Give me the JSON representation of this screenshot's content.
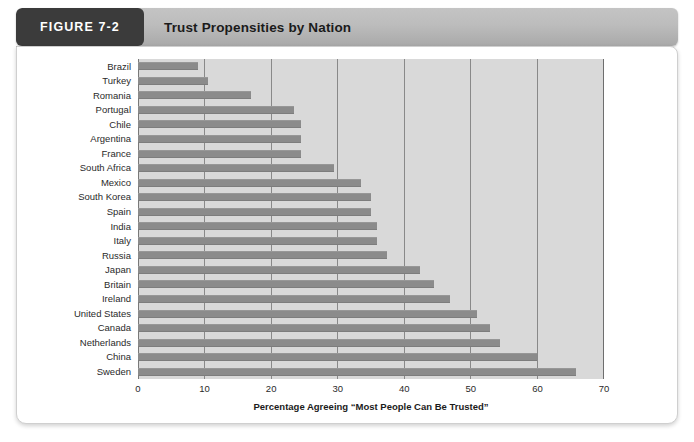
{
  "header": {
    "figure_tag": "FIGURE 7-2",
    "title": "Trust Propensities by Nation"
  },
  "chart_data": {
    "type": "bar",
    "orientation": "horizontal",
    "title": "Trust Propensities by Nation",
    "xlabel": "Percentage Agreeing “Most People Can Be Trusted”",
    "ylabel": "",
    "xlim": [
      0,
      70
    ],
    "xticks": [
      0,
      10,
      20,
      30,
      40,
      50,
      60,
      70
    ],
    "xtick_labels": [
      "0",
      "10",
      "20",
      "30",
      "40",
      "50",
      "60",
      "70"
    ],
    "grid": true,
    "legend": false,
    "bar_color": "#8b8b8b",
    "plot_background": "#d9d9d9",
    "categories": [
      "Brazil",
      "Turkey",
      "Romania",
      "Portugal",
      "Chile",
      "Argentina",
      "France",
      "South Africa",
      "Mexico",
      "South Korea",
      "Spain",
      "India",
      "Italy",
      "Russia",
      "Japan",
      "Britain",
      "Ireland",
      "United States",
      "Canada",
      "Netherlands",
      "China",
      "Sweden"
    ],
    "values": [
      9,
      10.5,
      17,
      23.5,
      24.5,
      24.5,
      24.5,
      29.5,
      33.5,
      35,
      35,
      36,
      36,
      37.5,
      42.5,
      44.5,
      47,
      51,
      53,
      54.5,
      60,
      66
    ]
  }
}
